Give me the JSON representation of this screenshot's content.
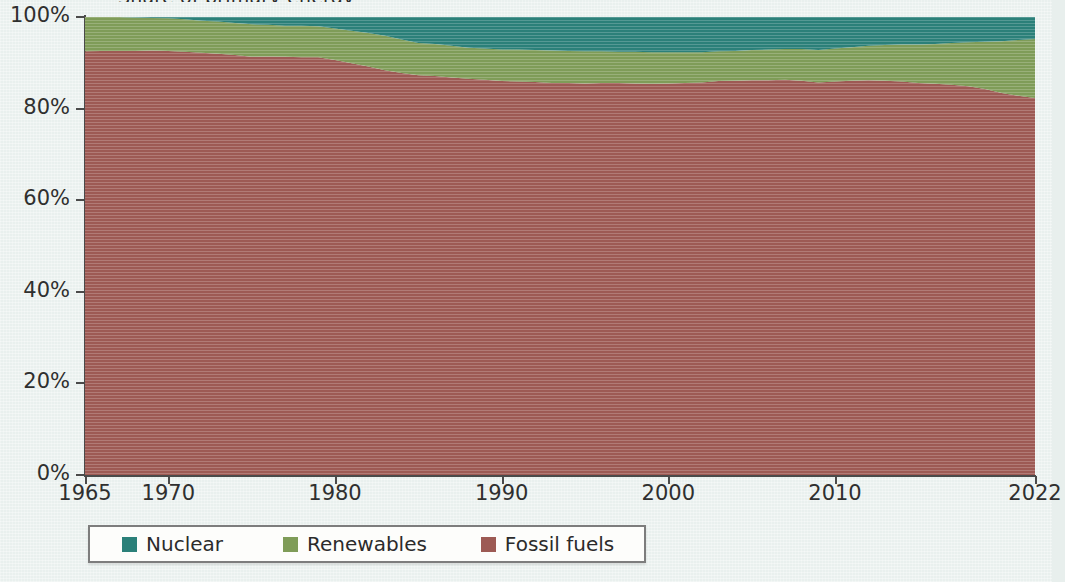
{
  "chart_data": {
    "type": "area",
    "stacked": true,
    "normalized": true,
    "title": "Share of primary energy",
    "title_cropped": true,
    "xlabel": "",
    "ylabel": "",
    "xlim": [
      1965,
      2022
    ],
    "ylim": [
      0,
      100
    ],
    "grid": true,
    "grid_axis": "y",
    "legend_position": "bottom-left",
    "x_tick_labels": [
      "1965",
      "1970",
      "1980",
      "1990",
      "2000",
      "2010",
      "2022"
    ],
    "x_tick_values": [
      1965,
      1970,
      1980,
      1990,
      2000,
      2010,
      2022
    ],
    "y_tick_labels": [
      "0%",
      "20%",
      "40%",
      "60%",
      "80%",
      "100%"
    ],
    "y_tick_values": [
      0,
      20,
      40,
      60,
      80,
      100
    ],
    "x": [
      1965,
      1966,
      1967,
      1968,
      1969,
      1970,
      1971,
      1972,
      1973,
      1974,
      1975,
      1976,
      1977,
      1978,
      1979,
      1980,
      1981,
      1982,
      1983,
      1984,
      1985,
      1986,
      1987,
      1988,
      1989,
      1990,
      1991,
      1992,
      1993,
      1994,
      1995,
      1996,
      1997,
      1998,
      1999,
      2000,
      2001,
      2002,
      2003,
      2004,
      2005,
      2006,
      2007,
      2008,
      2009,
      2010,
      2011,
      2012,
      2013,
      2014,
      2015,
      2016,
      2017,
      2018,
      2019,
      2020,
      2021,
      2022
    ],
    "series": [
      {
        "name": "Fossil fuels",
        "color": "#9d5a54",
        "stack_order": 1,
        "values": [
          92.5,
          92.6,
          92.6,
          92.6,
          92.7,
          92.6,
          92.4,
          92.2,
          92.0,
          91.7,
          91.3,
          91.4,
          91.3,
          91.2,
          91.2,
          90.6,
          89.9,
          89.2,
          88.4,
          87.8,
          87.3,
          87.1,
          86.8,
          86.5,
          86.3,
          86.0,
          85.9,
          85.8,
          85.6,
          85.6,
          85.5,
          85.6,
          85.6,
          85.5,
          85.4,
          85.5,
          85.6,
          85.7,
          86.0,
          86.1,
          86.2,
          86.2,
          86.3,
          86.1,
          85.7,
          85.9,
          86.1,
          86.2,
          86.1,
          85.9,
          85.6,
          85.4,
          85.2,
          84.9,
          84.3,
          83.4,
          82.8,
          82.3
        ]
      },
      {
        "name": "Renewables",
        "color": "#7f9c58",
        "stack_order": 2,
        "values": [
          7.5,
          7.4,
          7.4,
          7.3,
          7.1,
          7.1,
          7.1,
          7.0,
          7.0,
          7.0,
          7.1,
          6.9,
          6.8,
          6.9,
          6.8,
          6.9,
          7.1,
          7.3,
          7.5,
          7.3,
          7.0,
          7.0,
          6.9,
          6.8,
          6.8,
          6.9,
          7.0,
          7.0,
          7.1,
          7.0,
          7.0,
          6.9,
          6.8,
          6.9,
          6.9,
          6.8,
          6.7,
          6.6,
          6.5,
          6.5,
          6.6,
          6.7,
          6.7,
          6.9,
          7.1,
          7.2,
          7.3,
          7.5,
          7.8,
          8.1,
          8.4,
          8.7,
          9.1,
          9.6,
          10.3,
          11.3,
          12.2,
          12.9
        ]
      },
      {
        "name": "Nuclear",
        "color": "#2b8079",
        "stack_order": 3,
        "values": [
          0.0,
          0.0,
          0.0,
          0.1,
          0.2,
          0.3,
          0.5,
          0.8,
          1.0,
          1.3,
          1.6,
          1.7,
          1.9,
          1.9,
          2.0,
          2.5,
          3.0,
          3.5,
          4.1,
          4.9,
          5.7,
          5.9,
          6.3,
          6.7,
          6.9,
          7.1,
          7.1,
          7.2,
          7.3,
          7.4,
          7.5,
          7.5,
          7.6,
          7.6,
          7.7,
          7.7,
          7.7,
          7.7,
          7.5,
          7.4,
          7.2,
          7.1,
          7.0,
          7.0,
          7.2,
          6.9,
          6.6,
          6.3,
          6.1,
          6.0,
          6.0,
          5.9,
          5.7,
          5.5,
          5.4,
          5.3,
          5.0,
          4.8
        ]
      }
    ]
  },
  "legend": {
    "items": [
      {
        "label": "Nuclear",
        "color": "#2b8079"
      },
      {
        "label": "Renewables",
        "color": "#7f9c58"
      },
      {
        "label": "Fossil fuels",
        "color": "#9d5a54"
      }
    ]
  },
  "axis": {
    "y_labels": [
      "100%",
      "80%",
      "60%",
      "40%",
      "20%",
      "0%"
    ],
    "x_labels": [
      "1965",
      "1970",
      "1980",
      "1990",
      "2000",
      "2010",
      "2022"
    ]
  }
}
